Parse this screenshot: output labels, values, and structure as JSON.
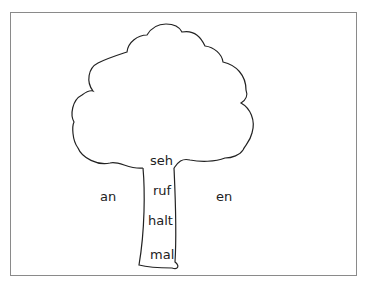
{
  "worksheet": {
    "trunk_words": [
      "seh",
      "ruf",
      "halt",
      "mal"
    ],
    "left_prefix": "an",
    "right_suffix": "en"
  },
  "colors": {
    "frame": "#8a8a8a",
    "outline": "#222222",
    "text": "#222222"
  }
}
